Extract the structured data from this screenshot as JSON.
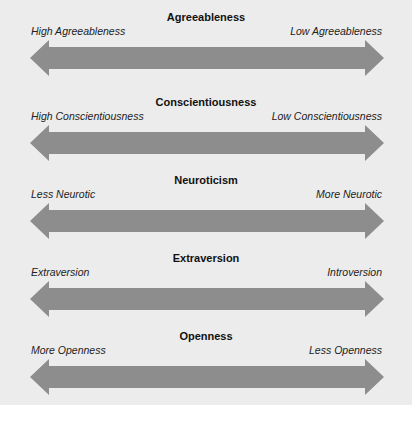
{
  "colors": {
    "background_panel": "#ececec",
    "arrow_fill": "#8d8d8d",
    "text": "#111111"
  },
  "scales": [
    {
      "title": "Agreeableness",
      "left_label": "High Agreeableness",
      "right_label": "Low Agreeableness"
    },
    {
      "title": "Conscientiousness",
      "left_label": "High Conscientiousness",
      "right_label": "Low Conscientiousness"
    },
    {
      "title": "Neuroticism",
      "left_label": "Less Neurotic",
      "right_label": "More Neurotic"
    },
    {
      "title": "Extraversion",
      "left_label": "Extraversion",
      "right_label": "Introversion"
    },
    {
      "title": "Openness",
      "left_label": "More Openness",
      "right_label": "Less Openness"
    }
  ]
}
